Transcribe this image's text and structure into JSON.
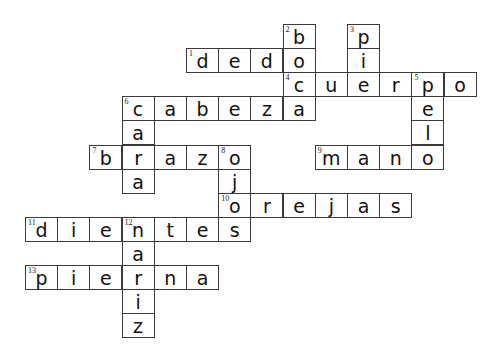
{
  "puzzle": {
    "title": "",
    "words": [
      {
        "number": "1",
        "answer": "dedo",
        "direction": "across",
        "row": 1,
        "col": 5
      },
      {
        "number": "2",
        "answer": "boca",
        "direction": "down",
        "row": 0,
        "col": 8
      },
      {
        "number": "3",
        "answer": "pie",
        "direction": "down",
        "row": 0,
        "col": 10
      },
      {
        "number": "4",
        "answer": "cuerpo",
        "direction": "across",
        "row": 2,
        "col": 8
      },
      {
        "number": "5",
        "answer": "pelo",
        "direction": "down",
        "row": 2,
        "col": 12
      },
      {
        "number": "6",
        "answer": "cabeza",
        "direction": "across",
        "row": 3,
        "col": 3
      },
      {
        "number": "6",
        "answer": "cara",
        "direction": "down",
        "row": 3,
        "col": 3
      },
      {
        "number": "7",
        "answer": "brazo",
        "direction": "across",
        "row": 5,
        "col": 2
      },
      {
        "number": "8",
        "answer": "ojos",
        "direction": "down",
        "row": 5,
        "col": 6
      },
      {
        "number": "9",
        "answer": "mano",
        "direction": "across",
        "row": 5,
        "col": 9
      },
      {
        "number": "10",
        "answer": "orejas",
        "direction": "across",
        "row": 7,
        "col": 6
      },
      {
        "number": "11",
        "answer": "dientes",
        "direction": "across",
        "row": 8,
        "col": 0
      },
      {
        "number": "12",
        "answer": "nariz",
        "direction": "down",
        "row": 8,
        "col": 3
      },
      {
        "number": "13",
        "answer": "pierna",
        "direction": "across",
        "row": 10,
        "col": 0
      }
    ]
  }
}
